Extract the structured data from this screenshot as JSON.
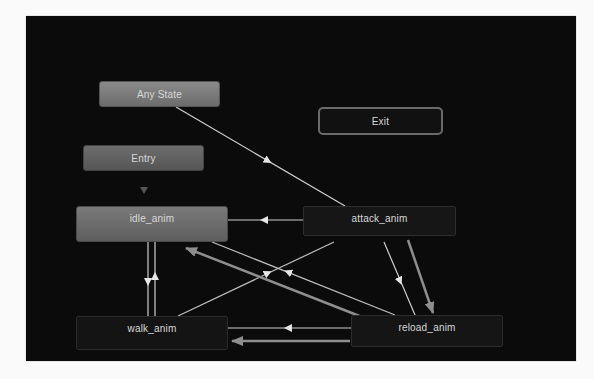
{
  "graph": {
    "background": "#0b0b0b",
    "nodes": {
      "any_state": {
        "label": "Any State"
      },
      "exit": {
        "label": "Exit"
      },
      "entry": {
        "label": "Entry"
      },
      "idle": {
        "label": "idle_anim"
      },
      "attack": {
        "label": "attack_anim"
      },
      "walk": {
        "label": "walk_anim"
      },
      "reload": {
        "label": "reload_anim"
      }
    },
    "transitions": [
      {
        "from": "Any State",
        "to": "attack_anim"
      },
      {
        "from": "Entry",
        "to": "idle_anim"
      },
      {
        "from": "attack_anim",
        "to": "idle_anim"
      },
      {
        "from": "idle_anim",
        "to": "walk_anim"
      },
      {
        "from": "walk_anim",
        "to": "idle_anim"
      },
      {
        "from": "walk_anim",
        "to": "attack_anim"
      },
      {
        "from": "reload_anim",
        "to": "idle_anim"
      },
      {
        "from": "reload_anim",
        "to": "idle_anim",
        "highlighted": true
      },
      {
        "from": "attack_anim",
        "to": "reload_anim"
      },
      {
        "from": "attack_anim",
        "to": "reload_anim",
        "highlighted": true
      },
      {
        "from": "reload_anim",
        "to": "walk_anim"
      },
      {
        "from": "reload_anim",
        "to": "walk_anim",
        "highlighted": true
      }
    ]
  }
}
